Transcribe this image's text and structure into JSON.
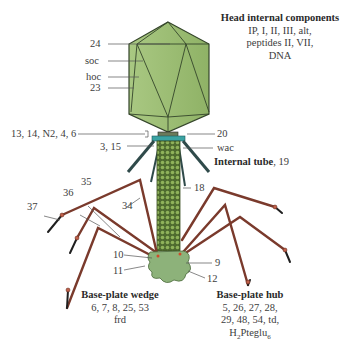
{
  "diagram": {
    "colors": {
      "head_fill": "#9bbd6e",
      "head_edge": "#3b4a2a",
      "tail_sheath": "#5c7a3a",
      "collar": "#3aa3a3",
      "whisker": "#2f4a4a",
      "tail_fiber": "#7a3a2c",
      "tail_fiber_tip": "#222222",
      "base_plate": "#8db27a",
      "caption": "#cfe3ef"
    },
    "labels": {
      "p24": "24",
      "soc": "soc",
      "hoc": "hoc",
      "p23": "23",
      "neck": "13, 14, N2, 4, 6",
      "p20": "20",
      "p3_15": "3, 15",
      "wac": "wac",
      "p18": "18",
      "p35": "35",
      "p36": "36",
      "p34": "34",
      "p37": "37",
      "p10": "10",
      "p11": "11",
      "p9": "9",
      "p12": "12"
    },
    "head_internal": {
      "title": "Head internal components",
      "lines": [
        "IP, I, II, III, alt,",
        "peptides II, VII,",
        "DNA"
      ]
    },
    "internal_tube": {
      "title": "Internal tube",
      "value": ", 19"
    },
    "base_plate_wedge": {
      "title": "Base-plate wedge",
      "lines": [
        "6, 7, 8, 25, 53",
        "frd"
      ]
    },
    "base_plate_hub": {
      "title": "Base-plate hub",
      "lines": [
        "5, 26, 27, 28,",
        "29, 48, 54, td,"
      ],
      "formula_main": "H",
      "formula_sub1": "2",
      "formula_mid": "Pteglu",
      "formula_sub2": "6"
    }
  }
}
